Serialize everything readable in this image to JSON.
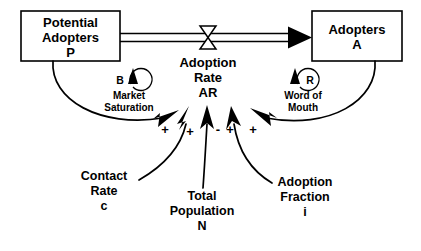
{
  "diagram": {
    "stocks": [
      {
        "id": "potential",
        "lines": [
          "Potential",
          "Adopters",
          "P"
        ]
      },
      {
        "id": "adopters",
        "lines": [
          "Adopters",
          "A"
        ]
      }
    ],
    "flow": {
      "id": "adoption-rate",
      "lines": [
        "Adoption",
        "Rate",
        "AR"
      ]
    },
    "loops": [
      {
        "id": "balancing",
        "marker": "B",
        "lines": [
          "Market",
          "Saturation"
        ]
      },
      {
        "id": "reinforcing",
        "marker": "R",
        "lines": [
          "Word of",
          "Mouth"
        ]
      }
    ],
    "auxiliaries": [
      {
        "id": "contact-rate",
        "lines": [
          "Contact",
          "Rate",
          "c"
        ]
      },
      {
        "id": "total-population",
        "lines": [
          "Total",
          "Population",
          "N"
        ]
      },
      {
        "id": "adoption-fraction",
        "lines": [
          "Adoption",
          "Fraction",
          "i"
        ]
      }
    ],
    "polarities": [
      {
        "id": "potential-to-rate",
        "sign": "+"
      },
      {
        "id": "contact-rate-to-rate",
        "sign": "+"
      },
      {
        "id": "total-population-to-rate",
        "sign": "-"
      },
      {
        "id": "adoption-fraction-to-rate",
        "sign": "+"
      },
      {
        "id": "adopters-to-rate",
        "sign": "+"
      }
    ],
    "colors": {
      "stroke": "#000000",
      "background": "#ffffff",
      "text": "#000000"
    }
  }
}
